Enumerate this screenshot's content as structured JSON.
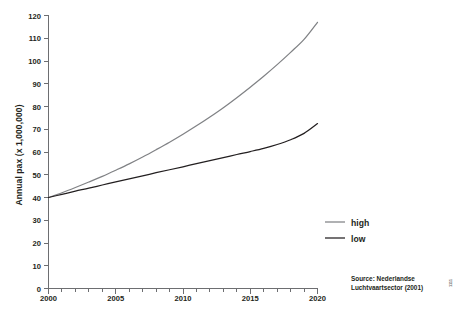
{
  "chart_data": {
    "type": "line",
    "title": "",
    "xlabel": "",
    "ylabel": "Annual pax (x 1,000,000)",
    "xlim": [
      2000,
      2020
    ],
    "ylim": [
      0,
      120
    ],
    "grid": false,
    "legend_position": "center-right",
    "x": [
      2000,
      2001,
      2002,
      2003,
      2004,
      2005,
      2006,
      2007,
      2008,
      2009,
      2010,
      2011,
      2012,
      2013,
      2014,
      2015,
      2016,
      2017,
      2018,
      2019,
      2020
    ],
    "x_tick_labels": [
      "2000",
      "2005",
      "2010",
      "2015",
      "2020"
    ],
    "x_tick_values": [
      2000,
      2005,
      2010,
      2015,
      2020
    ],
    "x_minor_tick_interval": 1,
    "y_tick_labels": [
      "0",
      "10",
      "20",
      "30",
      "40",
      "50",
      "60",
      "70",
      "80",
      "90",
      "100",
      "110",
      "120"
    ],
    "y_tick_values": [
      0,
      10,
      20,
      30,
      40,
      50,
      60,
      70,
      80,
      90,
      100,
      110,
      120
    ],
    "series": [
      {
        "name": "high",
        "color": "#808285",
        "values": [
          40.0,
          42.1,
          44.4,
          46.8,
          49.3,
          52.0,
          54.8,
          57.8,
          61.0,
          64.3,
          67.8,
          71.5,
          75.4,
          79.5,
          83.9,
          88.5,
          93.3,
          98.4,
          103.8,
          109.5,
          117.0
        ]
      },
      {
        "name": "low",
        "color": "#231f20",
        "values": [
          40.0,
          41.4,
          42.8,
          44.1,
          45.5,
          46.9,
          48.2,
          49.5,
          50.9,
          52.2,
          53.5,
          54.9,
          56.2,
          57.5,
          58.9,
          60.2,
          61.6,
          63.3,
          65.4,
          68.2,
          72.5
        ]
      }
    ]
  },
  "legend": {
    "items": [
      {
        "label": "high"
      },
      {
        "label": "low"
      }
    ]
  },
  "source": {
    "line1": "Source: Nederlandse",
    "line2": "Luchtvaartsector (2001)"
  },
  "credit": {
    "text": "1111"
  }
}
